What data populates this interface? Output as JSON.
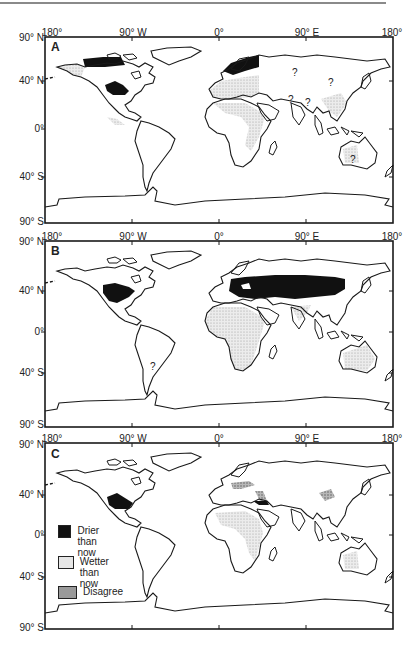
{
  "figure": {
    "panels": [
      {
        "id": "A",
        "label": "A",
        "lon_labels": [
          "180°",
          "90° W",
          "0°",
          "90° E",
          "180°"
        ],
        "lat_labels": [
          "90° N",
          "40° N",
          "0°",
          "40° S",
          "90° S"
        ],
        "question_marks": [
          "?",
          "?",
          "?",
          "?",
          "?"
        ]
      },
      {
        "id": "B",
        "label": "B",
        "lon_labels": [
          "180°",
          "90° W",
          "0°",
          "90° E",
          "180°"
        ],
        "lat_labels": [
          "90° N",
          "40° N",
          "0°",
          "40° S",
          "90° S"
        ],
        "question_marks": [
          "?"
        ]
      },
      {
        "id": "C",
        "label": "C",
        "lon_labels": [
          "180°",
          "90° W",
          "0°",
          "90° E",
          "180°"
        ],
        "lat_labels": [
          "90° N",
          "40° N",
          "0°",
          "40° S",
          "90° S"
        ]
      }
    ],
    "legend": {
      "items": [
        {
          "label": "Drier\nthan now",
          "pattern": "solid-black"
        },
        {
          "label": "Wetter\nthan now",
          "pattern": "light-stipple"
        },
        {
          "label": "Disagree",
          "pattern": "dark-stipple"
        }
      ]
    },
    "colors": {
      "drier": "#111111",
      "wetter": "#d9d9d9",
      "disagree": "#9a9a9a",
      "coastline": "#1a1a1a",
      "background": "#ffffff"
    }
  }
}
